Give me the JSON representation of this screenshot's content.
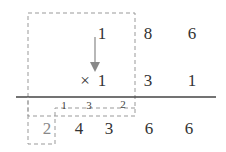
{
  "row1": {
    "d0": "1",
    "d1": "8",
    "d2": "6"
  },
  "row2": {
    "op": "×",
    "d0": "1",
    "d1": "3",
    "d2": "1"
  },
  "carries": {
    "c0": "1",
    "c1": "3",
    "c2": "2"
  },
  "result": {
    "carry_out": "2",
    "d0": "4",
    "d1": "3",
    "d2": "6",
    "d3": "6"
  },
  "colors": {
    "digits": "#333333",
    "dash": "#999999",
    "arrow": "#888888",
    "rule": "#444444"
  }
}
